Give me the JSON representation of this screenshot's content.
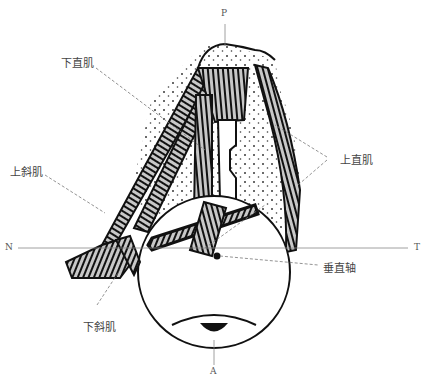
{
  "diagram": {
    "labels": {
      "inferior_rectus": "下直肌",
      "superior_oblique": "上斜肌",
      "superior_rectus": "上直肌",
      "inferior_oblique": "下斜肌",
      "vertical_axis": "垂直轴"
    },
    "axes": {
      "posterior": "P",
      "anterior": "A",
      "nasal": "N",
      "temporal": "T"
    }
  }
}
